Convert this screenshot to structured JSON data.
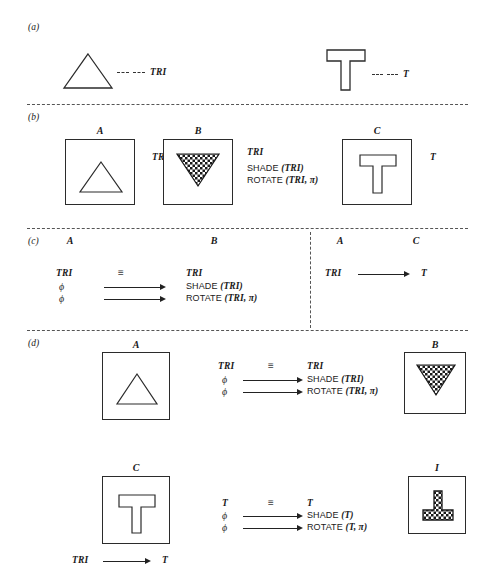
{
  "figure": {
    "background": "#ffffff",
    "ink": "#1a1a1a",
    "dash_color": "#555555"
  },
  "panels": [
    {
      "id": "a",
      "label": "(a)"
    },
    {
      "id": "b",
      "label": "(b)"
    },
    {
      "id": "c",
      "label": "(c)"
    },
    {
      "id": "d",
      "label": "(d)"
    }
  ],
  "panel_a": {
    "items": [
      {
        "shape": "triangle-outline",
        "leader": "dashed",
        "label": "TRI"
      },
      {
        "shape": "tee-outline",
        "leader": "dashed",
        "label": "T"
      }
    ]
  },
  "panel_b": {
    "boxes": [
      {
        "letter": "A",
        "shape": "triangle-outline"
      },
      {
        "letter": "B",
        "shape": "triangle-inverted-checkered"
      },
      {
        "letter": "C",
        "shape": "tee-outline"
      }
    ],
    "annotations": [
      {
        "text": "TRI"
      },
      {
        "text": "TRI"
      },
      {
        "op": "SHADE",
        "arg": "(TRI)"
      },
      {
        "op": "ROTATE",
        "arg": "(TRI, π)"
      },
      {
        "text": "T"
      }
    ]
  },
  "panel_c": {
    "left": {
      "col_left_letter": "A",
      "col_right_letter": "B",
      "rows": [
        {
          "from": "TRI",
          "rel": "≡",
          "to": "TRI"
        },
        {
          "from": "ϕ",
          "rel": "arrow",
          "to_op": "SHADE",
          "to_arg": "(TRI)"
        },
        {
          "from": "ϕ",
          "rel": "arrow",
          "to_op": "ROTATE",
          "to_arg": "(TRI, π)"
        }
      ]
    },
    "right": {
      "col_left_letter": "A",
      "col_right_letter": "C",
      "rows": [
        {
          "from": "TRI",
          "rel": "arrow",
          "to": "T"
        }
      ]
    }
  },
  "panel_d": {
    "row1": {
      "left_box": {
        "letter": "A",
        "shape": "triangle-outline"
      },
      "right_box": {
        "letter": "B",
        "shape": "triangle-inverted-checkered"
      },
      "rows": [
        {
          "from": "TRI",
          "rel": "≡",
          "to": "TRI"
        },
        {
          "from": "ϕ",
          "rel": "arrow",
          "to_op": "SHADE",
          "to_arg": "(TRI)"
        },
        {
          "from": "ϕ",
          "rel": "arrow",
          "to_op": "ROTATE",
          "to_arg": "(TRI, π)"
        }
      ]
    },
    "row2": {
      "left_box": {
        "letter": "C",
        "shape": "tee-outline"
      },
      "right_box": {
        "letter": "I",
        "shape": "tee-inverted-checkered"
      },
      "rows": [
        {
          "from": "T",
          "rel": "≡",
          "to": "T"
        },
        {
          "from": "ϕ",
          "rel": "arrow",
          "to_op": "SHADE",
          "to_arg": "(T)"
        },
        {
          "from": "ϕ",
          "rel": "arrow",
          "to_op": "ROTATE",
          "to_arg": "(T, π)"
        }
      ],
      "footnote": {
        "from": "TRI",
        "rel": "arrow",
        "to": "T"
      }
    }
  },
  "glyphs": {
    "equiv": "≡",
    "phi": "ϕ",
    "pi": "π"
  }
}
